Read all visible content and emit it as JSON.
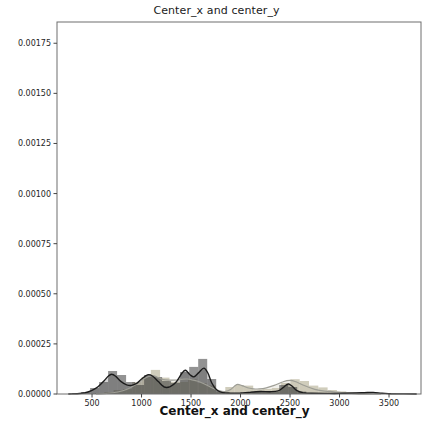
{
  "chart_data": {
    "type": "bar",
    "subtype": "histogram-with-kde-distplot",
    "title": "Center_x and center_y",
    "xlabel": "Center_x and center_y",
    "ylabel": "",
    "grid": false,
    "legend": "none",
    "xlim": [
      146,
      3823
    ],
    "ylim": [
      0,
      0.001856
    ],
    "x_ticks": [
      500,
      1000,
      1500,
      2000,
      2500,
      3000,
      3500
    ],
    "y_tick_values": [
      0,
      0.00025,
      0.0005,
      0.00075,
      0.001,
      0.00125,
      0.0015,
      0.00175
    ],
    "y_tick_labels": [
      "0.00000",
      "0.00025",
      "0.00050",
      "0.00075",
      "0.00100",
      "0.00125",
      "0.00150",
      "0.00175"
    ],
    "units_note": "density values below are in units of 1e-5",
    "series": [
      {
        "name": "light-gray-histogram",
        "kind": "bar",
        "color": "#c4c1ab",
        "opacity": 0.8,
        "bin_start": 530,
        "bin_width": 94,
        "density_x1e5": [
          0.4,
          1.0,
          2.0,
          2.5,
          6.0,
          8.5,
          12.0,
          8.2,
          6.0,
          6.0,
          7.3,
          5.5,
          4.3,
          1.0,
          3.5,
          4.5,
          4.2,
          2.2,
          2.5,
          3.0,
          5.5,
          7.4,
          6.5,
          4.2,
          3.3,
          2.0,
          1.3,
          0.8,
          0.4
        ]
      },
      {
        "name": "dark-gray-histogram",
        "kind": "bar",
        "color": "#3a3a3a",
        "opacity": 0.55,
        "bin_start": 298,
        "bin_width": 91,
        "density_x1e5": [
          0.4,
          1.0,
          3.0,
          6.0,
          11.5,
          9.5,
          6.0,
          4.5,
          9.5,
          8.5,
          6.5,
          5.5,
          11.0,
          13.5,
          17.5,
          7.5,
          1.5,
          0.4,
          0.3,
          0.4,
          1.0,
          1.3,
          1.0,
          4.5,
          3.5,
          1.2,
          0.4,
          0.2,
          0.2,
          0.2,
          0.3,
          0.4,
          0.7,
          0.7,
          0.4,
          0.2
        ]
      }
    ],
    "kde": [
      {
        "name": "light-gray-kde",
        "line_color": "#9e9e96",
        "fill_color": "#c4c1ab",
        "fill_opacity": 0.25,
        "line_width": 1.2,
        "points_x_density_x1e5": [
          [
            540,
            0.05
          ],
          [
            650,
            0.35
          ],
          [
            760,
            1.0
          ],
          [
            860,
            2.5
          ],
          [
            950,
            5.0
          ],
          [
            1020,
            7.5
          ],
          [
            1080,
            8.9
          ],
          [
            1115,
            9.2
          ],
          [
            1160,
            8.4
          ],
          [
            1220,
            7.2
          ],
          [
            1280,
            6.9
          ],
          [
            1350,
            7.0
          ],
          [
            1420,
            7.4
          ],
          [
            1460,
            7.5
          ],
          [
            1510,
            7.1
          ],
          [
            1570,
            6.4
          ],
          [
            1630,
            5.1
          ],
          [
            1700,
            3.4
          ],
          [
            1780,
            1.7
          ],
          [
            1840,
            1.2
          ],
          [
            1900,
            2.2
          ],
          [
            1960,
            4.7
          ],
          [
            2010,
            4.3
          ],
          [
            2070,
            3.1
          ],
          [
            2130,
            2.6
          ],
          [
            2190,
            2.55
          ],
          [
            2260,
            3.1
          ],
          [
            2340,
            4.3
          ],
          [
            2430,
            6.1
          ],
          [
            2500,
            6.8
          ],
          [
            2560,
            6.1
          ],
          [
            2650,
            4.1
          ],
          [
            2750,
            2.3
          ],
          [
            2850,
            1.4
          ],
          [
            2910,
            1.3
          ],
          [
            2970,
            0.9
          ],
          [
            3060,
            0.45
          ],
          [
            3160,
            0.18
          ],
          [
            3280,
            0.05
          ],
          [
            3420,
            0.0
          ]
        ]
      },
      {
        "name": "black-kde",
        "line_color": "#1b1b1b",
        "fill_color": "#3a3a3a",
        "fill_opacity": 0.22,
        "line_width": 1.4,
        "points_x_density_x1e5": [
          [
            260,
            0.02
          ],
          [
            350,
            0.15
          ],
          [
            430,
            0.6
          ],
          [
            500,
            1.8
          ],
          [
            560,
            3.6
          ],
          [
            620,
            6.5
          ],
          [
            665,
            9.0
          ],
          [
            700,
            9.9
          ],
          [
            740,
            8.8
          ],
          [
            790,
            6.3
          ],
          [
            850,
            4.6
          ],
          [
            900,
            4.3
          ],
          [
            950,
            5.3
          ],
          [
            1000,
            7.5
          ],
          [
            1060,
            9.6
          ],
          [
            1110,
            9.0
          ],
          [
            1170,
            6.2
          ],
          [
            1230,
            3.5
          ],
          [
            1290,
            3.7
          ],
          [
            1350,
            6.0
          ],
          [
            1410,
            10.5
          ],
          [
            1445,
            11.8
          ],
          [
            1490,
            9.6
          ],
          [
            1530,
            8.6
          ],
          [
            1580,
            10.8
          ],
          [
            1630,
            12.9
          ],
          [
            1670,
            10.5
          ],
          [
            1710,
            5.5
          ],
          [
            1760,
            2.0
          ],
          [
            1820,
            0.7
          ],
          [
            1900,
            0.45
          ],
          [
            2000,
            0.5
          ],
          [
            2100,
            0.9
          ],
          [
            2200,
            1.25
          ],
          [
            2300,
            1.15
          ],
          [
            2380,
            1.6
          ],
          [
            2440,
            3.6
          ],
          [
            2480,
            5.0
          ],
          [
            2520,
            4.0
          ],
          [
            2570,
            1.7
          ],
          [
            2630,
            0.7
          ],
          [
            2720,
            0.35
          ],
          [
            2850,
            0.3
          ],
          [
            3000,
            0.3
          ],
          [
            3150,
            0.5
          ],
          [
            3250,
            0.65
          ],
          [
            3340,
            0.8
          ],
          [
            3430,
            0.4
          ],
          [
            3520,
            0.12
          ],
          [
            3650,
            0.03
          ],
          [
            3780,
            0.0
          ]
        ]
      }
    ],
    "colors": {
      "spine": "#6e6e6e",
      "tick_mark": "#444444",
      "tick_text": "#262626",
      "background": "#ffffff"
    }
  }
}
